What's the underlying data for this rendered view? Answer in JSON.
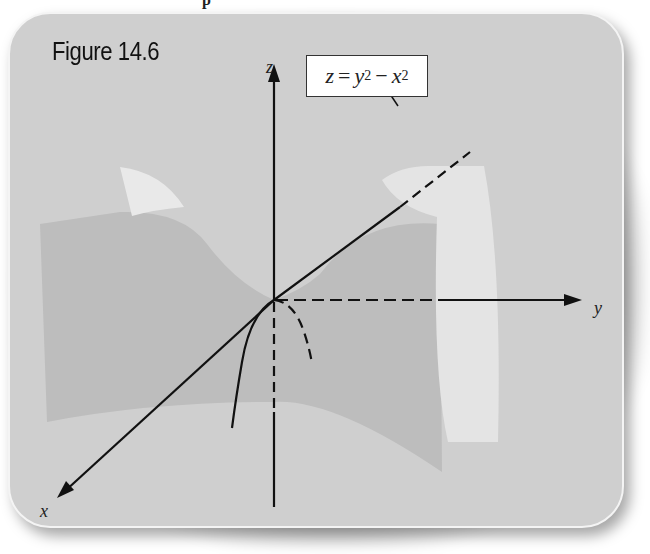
{
  "figure": {
    "title": "Figure 14.6",
    "equation": {
      "lhs": "z",
      "eq": "=",
      "term1_base": "y",
      "term1_exp": "2",
      "minus": "−",
      "term2_base": "x",
      "term2_exp": "2"
    },
    "axes": {
      "x_label": "x",
      "y_label": "y",
      "z_label": "z"
    },
    "surface": "hyperbolic paraboloid (saddle)",
    "colors": {
      "background": "#cfcfcf",
      "surface_front": "#b9b9b9",
      "surface_back": "#e6e6e6",
      "axis": "#111111",
      "label_box": "#ffffff"
    }
  }
}
